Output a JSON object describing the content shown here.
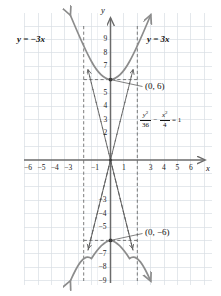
{
  "figure": {
    "name": "hyperbola-graph",
    "background_color": "#ffffff",
    "grid_color": "#d8dde3",
    "axis_color": "#6b6b6b",
    "curve_color": "#8c8c8c",
    "asymptote_color": "#5a5a5a",
    "leader_color": "#4a4a4a",
    "text_color": "#111111"
  },
  "labels": {
    "x_axis_name": "x",
    "y_axis_name": "y",
    "asymptote_left": "y = −3x",
    "asymptote_right": "y = 3x",
    "vertex_upper": "(0, 6)",
    "vertex_lower": "(0, −6)"
  },
  "equation": {
    "numerator_1": "y",
    "numerator_1_exp": "2",
    "denominator_1": "36",
    "operator": "−",
    "numerator_2": "x",
    "numerator_2_exp": "2",
    "denominator_2": "4",
    "equals": "= 1"
  },
  "ticks": {
    "x_labels": [
      "−6",
      "−5",
      "−4",
      "−3",
      "−1",
      "1",
      "3",
      "4",
      "5",
      "6"
    ],
    "y_labels": [
      "9",
      "8",
      "7",
      "5",
      "4",
      "3",
      "2",
      "−3",
      "−4",
      "−5",
      "−7",
      "−8",
      "−9"
    ]
  },
  "chart_data": {
    "type": "line",
    "title": "",
    "subtitle": "",
    "xlabel": "x",
    "ylabel": "y",
    "xlim": [
      -7,
      7
    ],
    "ylim": [
      -10,
      10
    ],
    "grid": true,
    "legend": "none",
    "conic": {
      "kind": "hyperbola",
      "orientation": "vertical",
      "equation": "y^2/36 - x^2/4 = 1",
      "a": 6,
      "b": 2,
      "c": 6.3246,
      "center": [
        0,
        0
      ],
      "vertices": [
        [
          0,
          6
        ],
        [
          0,
          -6
        ]
      ],
      "asymptote_slopes": [
        3,
        -3
      ],
      "asymptotes": [
        "y = 3x",
        "y = -3x"
      ],
      "fundamental_rectangle": {
        "x": [
          -2,
          2
        ],
        "y": [
          -6,
          6
        ]
      }
    },
    "annotations": [
      {
        "text": "(0, 6)",
        "point": [
          0,
          6
        ],
        "label_at": [
          2.6,
          5.5
        ]
      },
      {
        "text": "(0, −6)",
        "point": [
          0,
          -6
        ],
        "label_at": [
          2.6,
          -5.5
        ]
      },
      {
        "text": "y = 3x",
        "label_at": [
          3.0,
          8.3
        ]
      },
      {
        "text": "y = −3x",
        "label_at": [
          -5.6,
          8.3
        ]
      },
      {
        "text": "y^2/36 - x^2/4 = 1",
        "label_at": [
          3.0,
          2.3
        ]
      }
    ],
    "series": [
      {
        "name": "upper branch",
        "comment": "y = 6*sqrt(1 + x^2/4)",
        "x": [
          -3.0,
          -2.5,
          -2.0,
          -1.5,
          -1.0,
          -0.5,
          0.0,
          0.5,
          1.0,
          1.5,
          2.0,
          2.5,
          3.0
        ],
        "y": [
          10.82,
          9.6,
          8.49,
          7.5,
          6.71,
          6.18,
          6.0,
          6.18,
          6.71,
          7.5,
          8.49,
          9.6,
          10.82
        ]
      },
      {
        "name": "lower branch",
        "comment": "y = -6*sqrt(1 + x^2/4)",
        "x": [
          -3.0,
          -2.5,
          -2.0,
          -1.5,
          -1.0,
          -0.5,
          0.0,
          0.5,
          1.0,
          1.5,
          2.0,
          2.5,
          3.0
        ],
        "y": [
          -10.82,
          -9.6,
          -8.49,
          -7.5,
          -6.71,
          -6.18,
          -6.0,
          -6.18,
          -6.71,
          -7.5,
          -8.49,
          -9.6,
          -10.82
        ]
      },
      {
        "name": "asymptote y = 3x",
        "x": [
          -3.3,
          3.3
        ],
        "y": [
          -9.9,
          9.9
        ]
      },
      {
        "name": "asymptote y = -3x",
        "x": [
          -3.3,
          3.3
        ],
        "y": [
          9.9,
          -9.9
        ]
      }
    ]
  }
}
